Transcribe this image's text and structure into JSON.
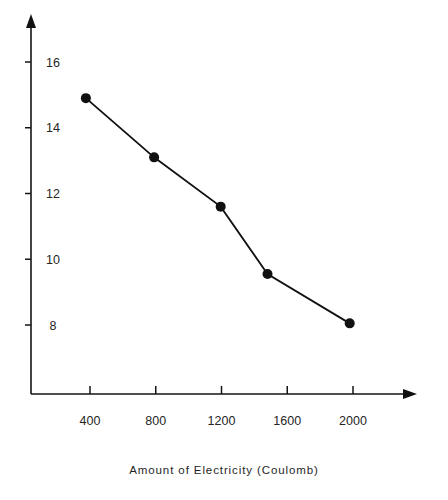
{
  "figure": {
    "clipped_top_text": "",
    "background_color": "#ffffff",
    "ink_color": "#111111"
  },
  "axes": {
    "x": {
      "caption": "Amount  of  Electricity    (Coulomb)",
      "tick_labels": [
        "400",
        "800",
        "1200",
        "1600",
        "2000"
      ],
      "tick_values": [
        400,
        800,
        1200,
        1600,
        2000
      ],
      "arrow": "right-arrow-icon"
    },
    "y": {
      "caption": "",
      "tick_labels": [
        "16",
        "14",
        "12",
        "10",
        "8"
      ],
      "tick_values": [
        16,
        14,
        12,
        10,
        8
      ],
      "arrow": "up-arrow-icon"
    }
  },
  "chart_data": {
    "type": "line",
    "title": "",
    "xlabel": "Amount of Electricity (Coulomb)",
    "ylabel": "",
    "xlim": [
      0,
      2250
    ],
    "ylim": [
      7.0,
      17.0
    ],
    "xticks": [
      400,
      800,
      1200,
      1600,
      2000
    ],
    "yticks": [
      8,
      10,
      12,
      14,
      16
    ],
    "grid": false,
    "legend": false,
    "marker": "filled-circle",
    "series": [
      {
        "name": "series-1",
        "color": "#111111",
        "x": [
          375,
          790,
          1195,
          1480,
          1980
        ],
        "y": [
          14.9,
          13.1,
          11.6,
          9.55,
          8.05
        ],
        "points": [
          {
            "x": 375,
            "y": 14.9
          },
          {
            "x": 790,
            "y": 13.1
          },
          {
            "x": 1195,
            "y": 11.6
          },
          {
            "x": 1480,
            "y": 9.55
          },
          {
            "x": 1980,
            "y": 8.05
          }
        ]
      }
    ]
  }
}
